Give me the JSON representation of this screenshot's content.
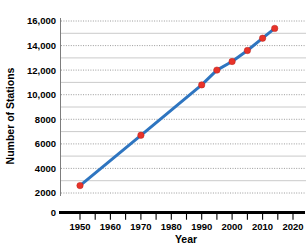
{
  "chart_data": {
    "type": "line",
    "title": "",
    "xlabel": "Year",
    "ylabel": "Number of Stations",
    "xlim": [
      1945,
      2021
    ],
    "ylim": [
      0,
      16000
    ],
    "grid": true,
    "legend": "none",
    "x_ticks": [
      "1950",
      "1960",
      "1970",
      "1980",
      "1990",
      "2000",
      "2010",
      "2020"
    ],
    "x_tick_values": [
      1950,
      1960,
      1970,
      1980,
      1990,
      2000,
      2010,
      2020
    ],
    "x_minor_tick_values": [
      1955,
      1965,
      1975,
      1985,
      1995,
      2005,
      2015
    ],
    "y_ticks": [
      "0",
      "2000",
      "4000",
      "6000",
      "8000",
      "10,000",
      "12,000",
      "14,000",
      "16,000"
    ],
    "y_tick_values": [
      0,
      2000,
      4000,
      6000,
      8000,
      10000,
      12000,
      14000,
      16000
    ],
    "y_minor_tick_values": [
      1000,
      3000,
      5000,
      7000,
      9000,
      11000,
      13000,
      15000
    ],
    "series": [
      {
        "name": "Number of Stations",
        "line_color": "#2E75C0",
        "marker_color": "#E8332A",
        "x": [
          1950,
          1970,
          1990,
          1995,
          2000,
          2005,
          2010,
          2014
        ],
        "values": [
          2600,
          6700,
          10800,
          12000,
          12700,
          13600,
          14600,
          15400
        ],
        "points": [
          {
            "year": 1950,
            "stations": 2600
          },
          {
            "year": 1970,
            "stations": 6700
          },
          {
            "year": 1990,
            "stations": 10800
          },
          {
            "year": 1995,
            "stations": 12000
          },
          {
            "year": 2000,
            "stations": 12700
          },
          {
            "year": 2005,
            "stations": 13600
          },
          {
            "year": 2010,
            "stations": 14600
          },
          {
            "year": 2014,
            "stations": 15400
          }
        ]
      }
    ]
  },
  "axes": {
    "x_title": "Year",
    "y_title": "Number of Stations"
  },
  "colors": {
    "line": "#2E75C0",
    "marker": "#E8332A",
    "gridline": "#8f8f8f",
    "axis": "#000000",
    "background": "#ffffff"
  }
}
